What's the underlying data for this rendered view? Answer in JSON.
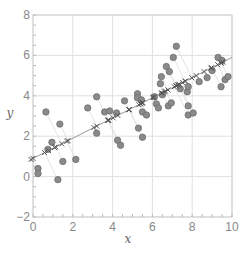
{
  "chart_data": {
    "type": "scatter",
    "title": "",
    "xlabel": "x",
    "ylabel": "y",
    "xlim": [
      0,
      10
    ],
    "ylim": [
      -2,
      8
    ],
    "xticks": [
      0,
      2,
      4,
      6,
      8,
      10
    ],
    "yticks": [
      -2,
      0,
      2,
      4,
      6,
      8
    ],
    "grid": true,
    "regression_line": {
      "intercept": 0.9,
      "slope": 0.5
    },
    "series": [
      {
        "name": "observations",
        "marker": "circle",
        "points": [
          [
            0.25,
            0.4
          ],
          [
            0.25,
            0.15
          ],
          [
            0.65,
            3.2
          ],
          [
            0.75,
            1.35
          ],
          [
            0.95,
            1.7
          ],
          [
            1.25,
            -0.15
          ],
          [
            1.35,
            2.6
          ],
          [
            1.5,
            0.75
          ],
          [
            2.15,
            0.85
          ],
          [
            2.75,
            3.4
          ],
          [
            3.2,
            3.95
          ],
          [
            3.2,
            2.15
          ],
          [
            3.6,
            3.2
          ],
          [
            3.85,
            3.25
          ],
          [
            4.2,
            3.15
          ],
          [
            4.25,
            1.8
          ],
          [
            4.4,
            1.55
          ],
          [
            4.6,
            3.75
          ],
          [
            5.25,
            4.1
          ],
          [
            5.25,
            3.9
          ],
          [
            5.3,
            2.4
          ],
          [
            5.45,
            3.8
          ],
          [
            5.5,
            3.2
          ],
          [
            5.5,
            1.95
          ],
          [
            5.7,
            3.05
          ],
          [
            6.1,
            3.95
          ],
          [
            6.2,
            3.6
          ],
          [
            6.3,
            3.4
          ],
          [
            6.4,
            4.6
          ],
          [
            6.45,
            4.95
          ],
          [
            6.5,
            4.05
          ],
          [
            6.7,
            5.45
          ],
          [
            6.8,
            3.5
          ],
          [
            6.85,
            5.2
          ],
          [
            6.95,
            3.65
          ],
          [
            7.05,
            5.9
          ],
          [
            7.2,
            6.45
          ],
          [
            7.4,
            4.35
          ],
          [
            7.75,
            4.2
          ],
          [
            7.8,
            4.45
          ],
          [
            7.8,
            3.5
          ],
          [
            7.8,
            3.05
          ],
          [
            8.05,
            3.15
          ],
          [
            8.35,
            4.7
          ],
          [
            8.75,
            4.9
          ],
          [
            9.0,
            5.25
          ],
          [
            9.3,
            5.9
          ],
          [
            9.45,
            4.45
          ],
          [
            9.5,
            5.75
          ],
          [
            9.65,
            4.8
          ],
          [
            9.8,
            4.95
          ]
        ]
      },
      {
        "name": "projections",
        "marker": "x",
        "note": "orthogonal projections of observations onto the fitted line"
      }
    ]
  }
}
